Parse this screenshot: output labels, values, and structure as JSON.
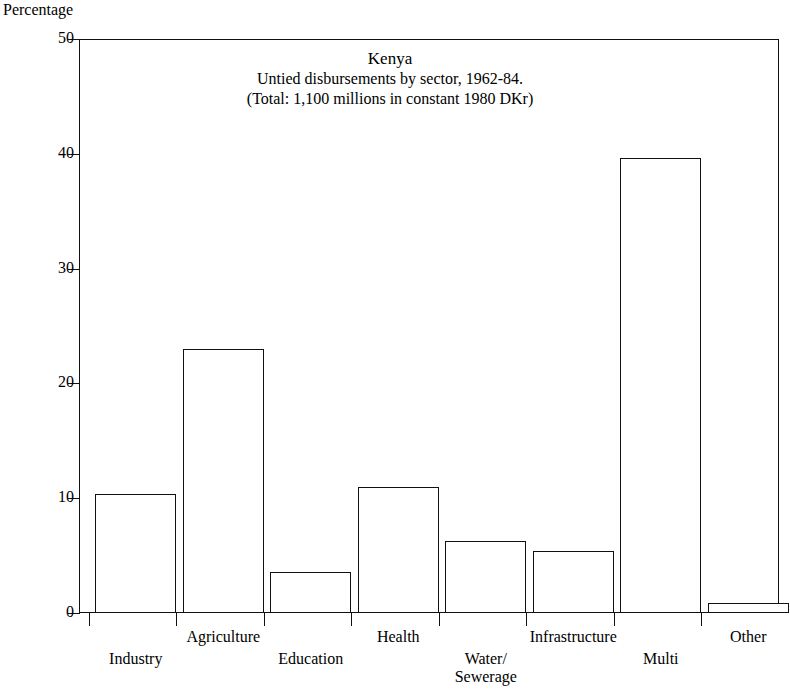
{
  "chart_data": {
    "type": "bar",
    "title": "Kenya",
    "subtitle_1": "Untied disbursements by sector, 1962-84.",
    "subtitle_2": "(Total: 1,100 millions in constant 1980 DKr)",
    "ylabel": "Percentage",
    "xlabel": "",
    "ylim": [
      0,
      50
    ],
    "yticks": [
      0,
      10,
      20,
      30,
      40,
      50
    ],
    "ytick_labels": [
      "0",
      "10",
      "20",
      "30",
      "40",
      "50"
    ],
    "grid": false,
    "legend": null,
    "categories": [
      "Industry",
      "Agriculture",
      "Education",
      "Health",
      "Water/\nSewerage",
      "Infrastructure",
      "Multi",
      "Other"
    ],
    "values": [
      10.4,
      23.0,
      3.6,
      11.0,
      6.3,
      5.4,
      39.6,
      0.9
    ],
    "bar_style": {
      "fill": "#ffffff",
      "edge": "#111111"
    }
  }
}
